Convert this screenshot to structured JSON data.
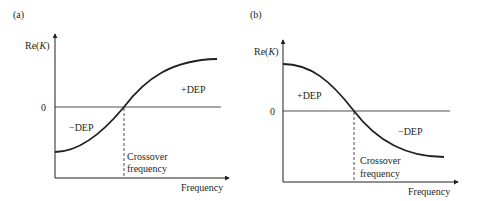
{
  "panels": [
    {
      "id": "a",
      "panel_label": "(a)",
      "y_axis_label": "Re(K)",
      "y_axis_label_prefix": "Re(",
      "y_axis_label_var": "K",
      "y_axis_label_suffix": ")",
      "zero_label": "0",
      "x_axis_label": "Frequency",
      "crossover_line1": "Crossover",
      "crossover_line2": "frequency",
      "upper_region_label": "+DEP",
      "lower_region_label": "−DEP",
      "curve_trend": "increasing sigmoid"
    },
    {
      "id": "b",
      "panel_label": "(b)",
      "y_axis_label": "Re(K)",
      "y_axis_label_prefix": "Re(",
      "y_axis_label_var": "K",
      "y_axis_label_suffix": ")",
      "zero_label": "0",
      "x_axis_label": "Frequency",
      "crossover_line1": "Crossover",
      "crossover_line2": "frequency",
      "upper_region_label": "+DEP",
      "lower_region_label": "−DEP",
      "curve_trend": "decreasing sigmoid"
    }
  ],
  "colors": {
    "ink": "#231f20",
    "background": "#ffffff"
  }
}
